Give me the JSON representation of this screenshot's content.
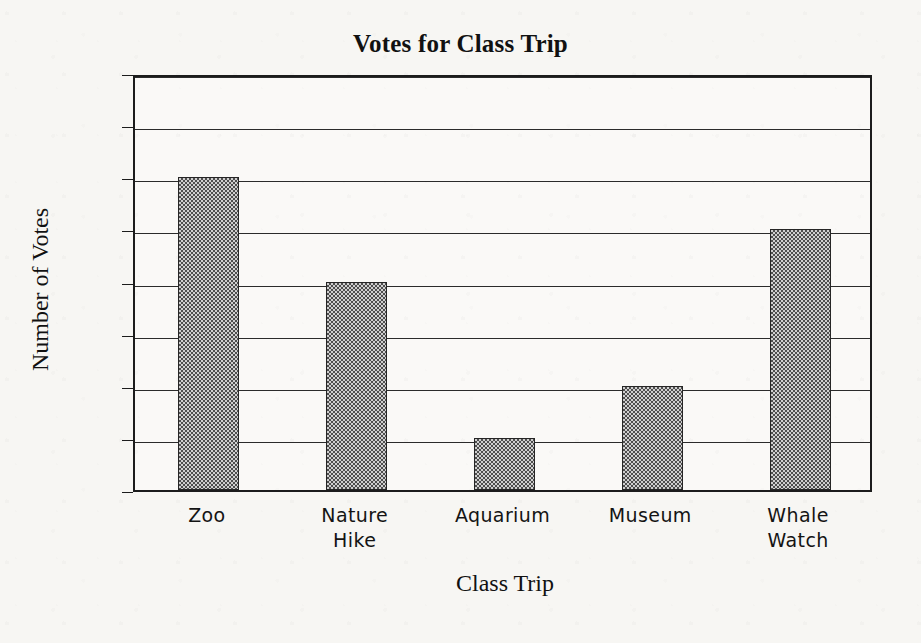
{
  "chart_data": {
    "type": "bar",
    "title": "Votes for Class Trip",
    "xlabel": "Class Trip",
    "ylabel": "Number of Votes",
    "categories": [
      "Zoo",
      "Nature Hike",
      "Aquarium",
      "Museum",
      "Whale Watch"
    ],
    "category_lines": [
      [
        "Zoo"
      ],
      [
        "Nature",
        "Hike"
      ],
      [
        "Aquarium"
      ],
      [
        "Museum"
      ],
      [
        "Whale",
        "Watch"
      ]
    ],
    "values": [
      6,
      4,
      1,
      2,
      5
    ],
    "ylim": [
      0,
      8
    ],
    "ytick_labels": [
      "0",
      "1",
      "2",
      "3",
      "4",
      "5",
      "6",
      "7",
      "8"
    ],
    "ytick_values": [
      0,
      1,
      2,
      3,
      4,
      5,
      6,
      7,
      8
    ],
    "grid": true,
    "grid_axis": "y",
    "legend": false,
    "bar_fill": "checkerboard-hatch",
    "bar_fill_color": "#cfcfcf",
    "bar_edge_color": "#262626",
    "axis_color": "#1c1c1c",
    "background_color": "#f7f6f3",
    "plot_background_color": "#faf9f7"
  }
}
